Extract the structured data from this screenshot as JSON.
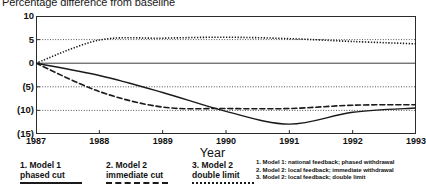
{
  "chart_data": {
    "type": "line",
    "title": "Percentage difference from baseline",
    "xlabel": "Year",
    "ylabel": "",
    "x": [
      1987,
      1988,
      1989,
      1990,
      1991,
      1992,
      1993
    ],
    "xlim": [
      1987,
      1993
    ],
    "ylim": [
      -15,
      10
    ],
    "yticks": [
      10,
      5,
      0,
      -5,
      -10,
      -15
    ],
    "ytick_labels": [
      "10",
      "5",
      "0",
      "(5)",
      "(10)",
      "(15)"
    ],
    "xtick_labels": [
      "1987",
      "1988",
      "1989",
      "1990",
      "1991",
      "1992",
      "1993"
    ],
    "grid": true,
    "grid_style": "dotted-horizontal",
    "legend_position": "below",
    "series": [
      {
        "name": "1. Model 1: national feedback; phased withdrawal",
        "short_name": "1. Model 1 phased cut",
        "style": "solid",
        "values": [
          0,
          -2.6,
          -6.2,
          -10.2,
          -12.9,
          -10.4,
          -9.5
        ]
      },
      {
        "name": "2. Model 2: local feedback; immediate withdrawal",
        "short_name": "2. Model 2 immediate cut",
        "style": "dashed",
        "values": [
          0,
          -6.0,
          -9.3,
          -9.6,
          -9.6,
          -8.9,
          -8.8
        ]
      },
      {
        "name": "3. Model 2: local feedback; double limit",
        "short_name": "3. Model 2 double limit",
        "style": "dotted",
        "values": [
          0,
          4.9,
          5.3,
          5.5,
          5.2,
          4.6,
          4.1
        ]
      }
    ]
  },
  "legend_left": {
    "entries": [
      {
        "label_line1": "1. Model 1",
        "label_line2": "phased cut",
        "style": "solid"
      },
      {
        "label_line1": "2. Model 2",
        "label_line2": "immediate cut",
        "style": "dashed"
      },
      {
        "label_line1": "3. Model 2",
        "label_line2": "double limit",
        "style": "dotted"
      }
    ]
  },
  "legend_right": {
    "lines": [
      "1. Model 1: national feedback; phased withdrawal",
      "2. Model 2: local feedback; immediate withdrawal",
      "3. Model 2: local feedback; double limit"
    ]
  },
  "colors": {
    "ink": "#1a1a1a",
    "frame": "#2b2b2b",
    "grid": "#555555",
    "background": "#ffffff"
  }
}
